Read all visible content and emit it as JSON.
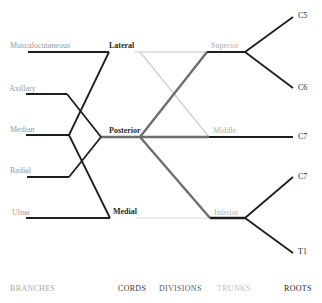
{
  "colors": {
    "dark": "#1e1e1e",
    "posterior_division": "#6e6e6e",
    "anterior_division_light": "#d6d6d6",
    "medial_light": "#e2e2e2",
    "branch_text": "#9a9a9a",
    "trunk_text": "#b0b0b0"
  },
  "branches": [
    {
      "label": "Musculocutaneous"
    },
    {
      "label": "Axillary"
    },
    {
      "label": "Median"
    },
    {
      "label": "Radial"
    },
    {
      "label": "Ulnar"
    }
  ],
  "cords": [
    {
      "label": "Lateral"
    },
    {
      "label": "Posterior"
    },
    {
      "label": "Medial"
    }
  ],
  "trunks": [
    {
      "label": "Superior"
    },
    {
      "label": "Middle"
    },
    {
      "label": "Inferior"
    }
  ],
  "roots": [
    {
      "label": "C5"
    },
    {
      "label": "C6"
    },
    {
      "label": "C7"
    },
    {
      "label": "C7"
    },
    {
      "label": "T1"
    }
  ],
  "columns": {
    "branches": "BRANCHES",
    "cords": "CORDS",
    "divisions": "DIVISIONS",
    "trunks": "TRUNKS",
    "roots": "ROOTS"
  }
}
